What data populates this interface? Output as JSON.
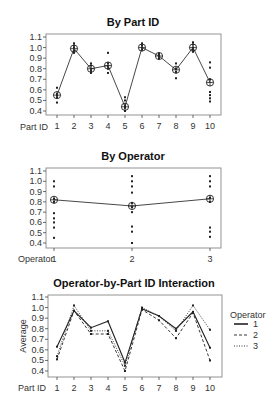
{
  "chart_data": [
    {
      "type": "line",
      "title": "By Part ID",
      "xlabel": "Part ID",
      "ylabel": "",
      "ylim": [
        0.4,
        1.1
      ],
      "yticks": [
        "0.4",
        "0.5",
        "0.6",
        "0.7",
        "0.8",
        "0.9",
        "1.0",
        "1.1"
      ],
      "categories": [
        "1",
        "2",
        "3",
        "4",
        "5",
        "6",
        "7",
        "8",
        "9",
        "10"
      ],
      "means": [
        0.55,
        0.99,
        0.8,
        0.83,
        0.44,
        1.0,
        0.92,
        0.79,
        1.0,
        0.67
      ],
      "points": [
        [
          0.48,
          0.55,
          0.56,
          0.62,
          0.53
        ],
        [
          0.95,
          0.97,
          1.0,
          1.02,
          1.04
        ],
        [
          0.76,
          0.78,
          0.8,
          0.83,
          0.85
        ],
        [
          0.76,
          0.8,
          0.82,
          0.85,
          0.95
        ],
        [
          0.4,
          0.43,
          0.45,
          0.5,
          0.53
        ],
        [
          0.98,
          1.0,
          1.02,
          1.04
        ],
        [
          0.9,
          0.92,
          0.94
        ],
        [
          0.71,
          0.77,
          0.8,
          0.85
        ],
        [
          0.96,
          0.98,
          1.0,
          1.03,
          1.05
        ],
        [
          0.49,
          0.52,
          0.55,
          0.58,
          0.7,
          0.81,
          0.86
        ]
      ],
      "grid": false
    },
    {
      "type": "line",
      "title": "By Operator",
      "xlabel": "Operator",
      "ylabel": "",
      "ylim": [
        0.4,
        1.1
      ],
      "yticks": [
        "0.4",
        "0.5",
        "0.6",
        "0.7",
        "0.8",
        "0.9",
        "1.0",
        "1.1"
      ],
      "categories": [
        "1",
        "2",
        "3"
      ],
      "means": [
        0.82,
        0.76,
        0.83
      ],
      "points": [
        [
          0.45,
          0.55,
          0.6,
          0.64,
          0.69,
          0.8,
          0.83,
          0.95,
          1.0
        ],
        [
          0.4,
          0.51,
          0.56,
          0.7,
          0.75,
          0.79,
          0.89,
          0.95,
          1.0,
          1.05
        ],
        [
          0.46,
          0.51,
          0.55,
          0.8,
          0.84,
          0.95,
          1.0,
          1.05
        ]
      ],
      "grid": false
    },
    {
      "type": "line",
      "title": "Operator-by-Part ID Interaction",
      "xlabel": "Part ID",
      "ylabel": "Average",
      "ylim": [
        0.4,
        1.1
      ],
      "yticks": [
        "0.4",
        "0.5",
        "0.6",
        "0.7",
        "0.8",
        "0.9",
        "1.0",
        "1.1"
      ],
      "categories": [
        "1",
        "2",
        "3",
        "4",
        "5",
        "6",
        "7",
        "8",
        "9",
        "10"
      ],
      "legend_title": "Operator",
      "legend_position": "right",
      "series": [
        {
          "name": "1",
          "style": "solid",
          "values": [
            0.63,
            0.97,
            0.81,
            0.87,
            0.48,
            0.99,
            0.92,
            0.8,
            0.96,
            0.62
          ]
        },
        {
          "name": "2",
          "style": "dashed",
          "values": [
            0.51,
            0.97,
            0.75,
            0.75,
            0.4,
            0.98,
            0.88,
            0.71,
            0.95,
            0.5
          ]
        },
        {
          "name": "3",
          "style": "dotted",
          "values": [
            0.54,
            1.02,
            0.78,
            0.78,
            0.45,
            1.0,
            0.92,
            0.78,
            1.02,
            0.79
          ]
        }
      ],
      "grid": false
    }
  ]
}
